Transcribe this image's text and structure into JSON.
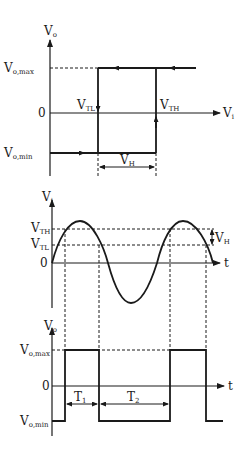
{
  "colors": {
    "ink": "#1a1a1a",
    "background": "#ffffff"
  },
  "transfer": {
    "y_axis": {
      "main": "V",
      "sub": "o"
    },
    "x_axis": {
      "main": "V",
      "sub": "i"
    },
    "vomax": {
      "main": "V",
      "sub": "o,max"
    },
    "vomin": {
      "main": "V",
      "sub": "o,min"
    },
    "zero": "0",
    "vtl": {
      "main": "V",
      "sub": "TL"
    },
    "vth": {
      "main": "V",
      "sub": "TH"
    },
    "vh": {
      "main": "V",
      "sub": "H"
    }
  },
  "input": {
    "y_axis": {
      "main": "V",
      "sub": "i"
    },
    "t_axis": "t",
    "vth": {
      "main": "V",
      "sub": "TH"
    },
    "vtl": {
      "main": "V",
      "sub": "TL"
    },
    "zero": "0",
    "vh": {
      "main": "V",
      "sub": "H"
    }
  },
  "output": {
    "y_axis": {
      "main": "V",
      "sub": "o"
    },
    "t_axis": "t",
    "vomax": {
      "main": "V",
      "sub": "o,max"
    },
    "vomin": {
      "main": "V",
      "sub": "o,min"
    },
    "zero": "0",
    "t1": {
      "main": "T",
      "sub": "1"
    },
    "t2": {
      "main": "T",
      "sub": "2"
    }
  }
}
